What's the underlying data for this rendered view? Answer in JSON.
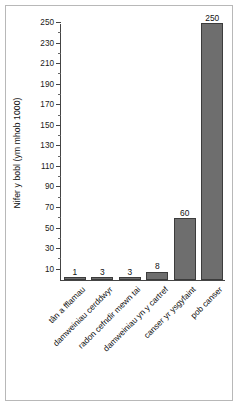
{
  "chart_data": {
    "type": "bar",
    "title": "",
    "subtitle": "",
    "xlabel": "",
    "ylabel": "Nifer y bobl (ym mhob 1000)",
    "categories": [
      "tân a fflamau",
      "damweiniau cerddwyr",
      "radon cefndir mewn tai",
      "damweiniau yn y cartref",
      "canser yr ysgyfaint",
      "pob canser"
    ],
    "values": [
      1,
      3,
      3,
      8,
      60,
      250
    ],
    "value_labels": [
      "1",
      "3",
      "3",
      "8",
      "60",
      "250"
    ],
    "ylim": [
      0,
      250
    ],
    "yticks": [
      10,
      30,
      50,
      70,
      90,
      110,
      130,
      150,
      170,
      190,
      210,
      230,
      250
    ],
    "ytick_labels": [
      "10",
      "30",
      "50",
      "70",
      "90",
      "110",
      "130",
      "150",
      "170",
      "190",
      "210",
      "230",
      "250"
    ],
    "yminor_ticks": [
      20,
      40,
      60,
      80,
      100,
      120,
      140,
      160,
      180,
      200,
      220,
      240
    ],
    "grid": false,
    "legend": false,
    "legend_position": "none",
    "bar_color": "#6e6e6e",
    "bar_edge_color": "#3c3c3c",
    "axis_color": "#444444",
    "background_color": "#ffffff",
    "frame_color": "#b8b8b8",
    "label_rotation": -45
  }
}
